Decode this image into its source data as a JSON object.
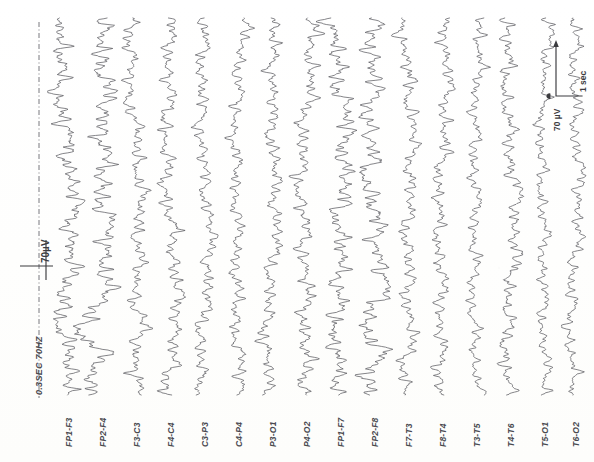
{
  "recording": {
    "title": "EEG Recording",
    "montage_type": "bipolar longitudinal",
    "channel_count": 16,
    "orientation": "page rotated 90 degrees; traces run vertically"
  },
  "annotations": {
    "filter_settings": "0.3SEC 70HZ",
    "left_calibration_label": "70µV",
    "scale_bar_amplitude": "70 µV",
    "scale_bar_time": "1 sec"
  },
  "channels": [
    {
      "label": "FP1-F3"
    },
    {
      "label": "FP2-F4"
    },
    {
      "label": "F3-C3"
    },
    {
      "label": "F4-C4"
    },
    {
      "label": "C3-P3"
    },
    {
      "label": "C4-P4"
    },
    {
      "label": "P3-O1"
    },
    {
      "label": "P4-O2"
    },
    {
      "label": "FP1-F7"
    },
    {
      "label": "FP2-F8"
    },
    {
      "label": "F7-T3"
    },
    {
      "label": "F8-T4"
    },
    {
      "label": "T3-T5"
    },
    {
      "label": "T4-T6"
    },
    {
      "label": "T5-O1"
    },
    {
      "label": "T6-O2"
    }
  ],
  "colors": {
    "paper": "#fdfdfc",
    "trace": "#55555a",
    "label": "#4a4a50",
    "calibration": "#3a3a3e"
  },
  "chart_data": {
    "type": "line",
    "xlabel": "time (page rotated: time runs vertically, top to bottom)",
    "ylabel": "amplitude (µV, deflection horizontal)",
    "grid": false,
    "legend": "none",
    "time_axis": {
      "direction": "vertical",
      "start_px": 18,
      "end_px": 395,
      "scale_bar_seconds": 1,
      "scale_bar_pixels": 52
    },
    "amplitude_axis": {
      "direction": "horizontal",
      "scale_bar_microvolts": 70,
      "scale_bar_pixels": 26
    },
    "series": [
      {
        "name": "FP1-F3",
        "baseline_x": 68,
        "amplitude_gain": 1.55,
        "seed": 11,
        "events": [
          {
            "t": 0.83,
            "amp": -9.0,
            "width": 0.06
          },
          {
            "t": 0.88,
            "amp": 6.5,
            "width": 0.035
          }
        ]
      },
      {
        "name": "FP2-F4",
        "baseline_x": 102,
        "amplitude_gain": 1.6,
        "seed": 23,
        "events": [
          {
            "t": 0.83,
            "amp": -10.5,
            "width": 0.06
          },
          {
            "t": 0.88,
            "amp": 7.0,
            "width": 0.035
          }
        ]
      },
      {
        "name": "F3-C3",
        "baseline_x": 136,
        "amplitude_gain": 1.15,
        "seed": 37,
        "events": [
          {
            "t": 0.82,
            "amp": 5.0,
            "width": 0.04
          },
          {
            "t": 0.86,
            "amp": -4.0,
            "width": 0.03
          }
        ]
      },
      {
        "name": "F4-C4",
        "baseline_x": 170,
        "amplitude_gain": 1.2,
        "seed": 53,
        "events": [
          {
            "t": 0.83,
            "amp": 4.0,
            "width": 0.038
          }
        ]
      },
      {
        "name": "C3-P3",
        "baseline_x": 204,
        "amplitude_gain": 1.05,
        "seed": 67,
        "events": []
      },
      {
        "name": "C4-P4",
        "baseline_x": 238,
        "amplitude_gain": 1.0,
        "seed": 79,
        "events": []
      },
      {
        "name": "P3-O1",
        "baseline_x": 272,
        "amplitude_gain": 1.1,
        "seed": 89,
        "events": []
      },
      {
        "name": "P4-O2",
        "baseline_x": 306,
        "amplitude_gain": 1.25,
        "seed": 101,
        "events": []
      },
      {
        "name": "FP1-F7",
        "baseline_x": 340,
        "amplitude_gain": 1.5,
        "seed": 113,
        "events": [
          {
            "t": 0.83,
            "amp": -8.0,
            "width": 0.058
          },
          {
            "t": 0.88,
            "amp": 6.0,
            "width": 0.034
          }
        ]
      },
      {
        "name": "FP2-F8",
        "baseline_x": 374,
        "amplitude_gain": 1.55,
        "seed": 127,
        "events": [
          {
            "t": 0.83,
            "amp": -9.5,
            "width": 0.058
          },
          {
            "t": 0.88,
            "amp": 6.5,
            "width": 0.034
          }
        ]
      },
      {
        "name": "F7-T3",
        "baseline_x": 408,
        "amplitude_gain": 1.1,
        "seed": 139,
        "events": [
          {
            "t": 0.84,
            "amp": 3.5,
            "width": 0.035
          }
        ]
      },
      {
        "name": "F8-T4",
        "baseline_x": 442,
        "amplitude_gain": 1.05,
        "seed": 151,
        "events": []
      },
      {
        "name": "T3-T5",
        "baseline_x": 476,
        "amplitude_gain": 0.95,
        "seed": 163,
        "events": []
      },
      {
        "name": "T4-T6",
        "baseline_x": 510,
        "amplitude_gain": 1.15,
        "seed": 179,
        "events": []
      },
      {
        "name": "T5-O1",
        "baseline_x": 544,
        "amplitude_gain": 0.9,
        "seed": 191,
        "events": []
      },
      {
        "name": "T6-O2",
        "baseline_x": 575,
        "amplitude_gain": 1.0,
        "seed": 199,
        "events": []
      }
    ]
  }
}
